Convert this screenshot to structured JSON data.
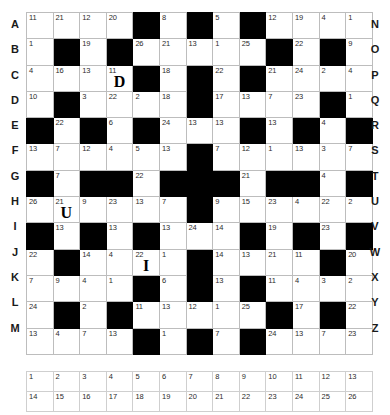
{
  "puzzle": {
    "type": "codeword",
    "rows": 13,
    "cols": 13,
    "row_labels_left": [
      "A",
      "B",
      "C",
      "D",
      "E",
      "F",
      "G",
      "H",
      "I",
      "J",
      "K",
      "L",
      "M"
    ],
    "row_labels_right": [
      "N",
      "O",
      "P",
      "Q",
      "R",
      "S",
      "T",
      "U",
      "V",
      "W",
      "X",
      "Y",
      "Z"
    ],
    "colors": {
      "black_cell": "#000000",
      "grid_line": "#bdbdbd",
      "text": "#2b2b2b"
    },
    "grid": [
      [
        {
          "black": false,
          "num": "11",
          "letter": ""
        },
        {
          "black": false,
          "num": "21",
          "letter": ""
        },
        {
          "black": false,
          "num": "12",
          "letter": ""
        },
        {
          "black": false,
          "num": "20",
          "letter": ""
        },
        {
          "black": true,
          "num": "",
          "letter": ""
        },
        {
          "black": false,
          "num": "8",
          "letter": ""
        },
        {
          "black": true,
          "num": "",
          "letter": ""
        },
        {
          "black": false,
          "num": "5",
          "letter": ""
        },
        {
          "black": true,
          "num": "",
          "letter": ""
        },
        {
          "black": false,
          "num": "12",
          "letter": ""
        },
        {
          "black": false,
          "num": "19",
          "letter": ""
        },
        {
          "black": false,
          "num": "4",
          "letter": ""
        },
        {
          "black": false,
          "num": "1",
          "letter": ""
        }
      ],
      [
        {
          "black": false,
          "num": "1",
          "letter": ""
        },
        {
          "black": true,
          "num": "",
          "letter": ""
        },
        {
          "black": false,
          "num": "19",
          "letter": ""
        },
        {
          "black": true,
          "num": "",
          "letter": ""
        },
        {
          "black": false,
          "num": "26",
          "letter": ""
        },
        {
          "black": false,
          "num": "21",
          "letter": ""
        },
        {
          "black": false,
          "num": "13",
          "letter": ""
        },
        {
          "black": false,
          "num": "1",
          "letter": ""
        },
        {
          "black": false,
          "num": "25",
          "letter": ""
        },
        {
          "black": true,
          "num": "",
          "letter": ""
        },
        {
          "black": false,
          "num": "22",
          "letter": ""
        },
        {
          "black": true,
          "num": "",
          "letter": ""
        },
        {
          "black": false,
          "num": "9",
          "letter": ""
        }
      ],
      [
        {
          "black": false,
          "num": "4",
          "letter": ""
        },
        {
          "black": false,
          "num": "16",
          "letter": ""
        },
        {
          "black": false,
          "num": "13",
          "letter": ""
        },
        {
          "black": false,
          "num": "11",
          "letter": "D"
        },
        {
          "black": true,
          "num": "",
          "letter": ""
        },
        {
          "black": false,
          "num": "18",
          "letter": ""
        },
        {
          "black": true,
          "num": "",
          "letter": ""
        },
        {
          "black": false,
          "num": "22",
          "letter": ""
        },
        {
          "black": true,
          "num": "",
          "letter": ""
        },
        {
          "black": false,
          "num": "21",
          "letter": ""
        },
        {
          "black": false,
          "num": "24",
          "letter": ""
        },
        {
          "black": false,
          "num": "2",
          "letter": ""
        },
        {
          "black": false,
          "num": "4",
          "letter": ""
        }
      ],
      [
        {
          "black": false,
          "num": "10",
          "letter": ""
        },
        {
          "black": true,
          "num": "",
          "letter": ""
        },
        {
          "black": false,
          "num": "3",
          "letter": ""
        },
        {
          "black": false,
          "num": "22",
          "letter": ""
        },
        {
          "black": false,
          "num": "2",
          "letter": ""
        },
        {
          "black": false,
          "num": "18",
          "letter": ""
        },
        {
          "black": true,
          "num": "",
          "letter": ""
        },
        {
          "black": false,
          "num": "17",
          "letter": ""
        },
        {
          "black": false,
          "num": "13",
          "letter": ""
        },
        {
          "black": false,
          "num": "7",
          "letter": ""
        },
        {
          "black": false,
          "num": "23",
          "letter": ""
        },
        {
          "black": true,
          "num": "",
          "letter": ""
        },
        {
          "black": false,
          "num": "1",
          "letter": ""
        }
      ],
      [
        {
          "black": true,
          "num": "",
          "letter": ""
        },
        {
          "black": false,
          "num": "22",
          "letter": ""
        },
        {
          "black": true,
          "num": "",
          "letter": ""
        },
        {
          "black": false,
          "num": "6",
          "letter": ""
        },
        {
          "black": true,
          "num": "",
          "letter": ""
        },
        {
          "black": false,
          "num": "24",
          "letter": ""
        },
        {
          "black": false,
          "num": "13",
          "letter": ""
        },
        {
          "black": false,
          "num": "13",
          "letter": ""
        },
        {
          "black": true,
          "num": "",
          "letter": ""
        },
        {
          "black": false,
          "num": "13",
          "letter": ""
        },
        {
          "black": true,
          "num": "",
          "letter": ""
        },
        {
          "black": false,
          "num": "4",
          "letter": ""
        },
        {
          "black": true,
          "num": "",
          "letter": ""
        }
      ],
      [
        {
          "black": false,
          "num": "13",
          "letter": ""
        },
        {
          "black": false,
          "num": "7",
          "letter": ""
        },
        {
          "black": false,
          "num": "12",
          "letter": ""
        },
        {
          "black": false,
          "num": "4",
          "letter": ""
        },
        {
          "black": false,
          "num": "5",
          "letter": ""
        },
        {
          "black": false,
          "num": "13",
          "letter": ""
        },
        {
          "black": true,
          "num": "",
          "letter": ""
        },
        {
          "black": false,
          "num": "7",
          "letter": ""
        },
        {
          "black": false,
          "num": "12",
          "letter": ""
        },
        {
          "black": false,
          "num": "1",
          "letter": ""
        },
        {
          "black": false,
          "num": "13",
          "letter": ""
        },
        {
          "black": false,
          "num": "3",
          "letter": ""
        },
        {
          "black": false,
          "num": "7",
          "letter": ""
        }
      ],
      [
        {
          "black": true,
          "num": "",
          "letter": ""
        },
        {
          "black": false,
          "num": "7",
          "letter": ""
        },
        {
          "black": true,
          "num": "",
          "letter": ""
        },
        {
          "black": true,
          "num": "",
          "letter": ""
        },
        {
          "black": false,
          "num": "22",
          "letter": ""
        },
        {
          "black": true,
          "num": "",
          "letter": ""
        },
        {
          "black": true,
          "num": "",
          "letter": ""
        },
        {
          "black": true,
          "num": "",
          "letter": ""
        },
        {
          "black": false,
          "num": "21",
          "letter": ""
        },
        {
          "black": true,
          "num": "",
          "letter": ""
        },
        {
          "black": true,
          "num": "",
          "letter": ""
        },
        {
          "black": false,
          "num": "4",
          "letter": ""
        },
        {
          "black": true,
          "num": "",
          "letter": ""
        }
      ],
      [
        {
          "black": false,
          "num": "26",
          "letter": ""
        },
        {
          "black": false,
          "num": "21",
          "letter": "U"
        },
        {
          "black": false,
          "num": "9",
          "letter": ""
        },
        {
          "black": false,
          "num": "23",
          "letter": ""
        },
        {
          "black": false,
          "num": "13",
          "letter": ""
        },
        {
          "black": false,
          "num": "7",
          "letter": ""
        },
        {
          "black": true,
          "num": "",
          "letter": ""
        },
        {
          "black": false,
          "num": "9",
          "letter": ""
        },
        {
          "black": false,
          "num": "15",
          "letter": ""
        },
        {
          "black": false,
          "num": "23",
          "letter": ""
        },
        {
          "black": false,
          "num": "4",
          "letter": ""
        },
        {
          "black": false,
          "num": "22",
          "letter": ""
        },
        {
          "black": false,
          "num": "2",
          "letter": ""
        }
      ],
      [
        {
          "black": true,
          "num": "",
          "letter": ""
        },
        {
          "black": false,
          "num": "13",
          "letter": ""
        },
        {
          "black": true,
          "num": "",
          "letter": ""
        },
        {
          "black": false,
          "num": "13",
          "letter": ""
        },
        {
          "black": true,
          "num": "",
          "letter": ""
        },
        {
          "black": false,
          "num": "13",
          "letter": ""
        },
        {
          "black": false,
          "num": "24",
          "letter": ""
        },
        {
          "black": false,
          "num": "14",
          "letter": ""
        },
        {
          "black": true,
          "num": "",
          "letter": ""
        },
        {
          "black": false,
          "num": "19",
          "letter": ""
        },
        {
          "black": true,
          "num": "",
          "letter": ""
        },
        {
          "black": false,
          "num": "23",
          "letter": ""
        },
        {
          "black": true,
          "num": "",
          "letter": ""
        }
      ],
      [
        {
          "black": false,
          "num": "22",
          "letter": ""
        },
        {
          "black": true,
          "num": "",
          "letter": ""
        },
        {
          "black": false,
          "num": "14",
          "letter": ""
        },
        {
          "black": false,
          "num": "4",
          "letter": ""
        },
        {
          "black": false,
          "num": "22",
          "letter": "I"
        },
        {
          "black": false,
          "num": "1",
          "letter": ""
        },
        {
          "black": true,
          "num": "",
          "letter": ""
        },
        {
          "black": false,
          "num": "14",
          "letter": ""
        },
        {
          "black": false,
          "num": "13",
          "letter": ""
        },
        {
          "black": false,
          "num": "21",
          "letter": ""
        },
        {
          "black": false,
          "num": "11",
          "letter": ""
        },
        {
          "black": true,
          "num": "",
          "letter": ""
        },
        {
          "black": false,
          "num": "20",
          "letter": ""
        }
      ],
      [
        {
          "black": false,
          "num": "7",
          "letter": ""
        },
        {
          "black": false,
          "num": "9",
          "letter": ""
        },
        {
          "black": false,
          "num": "4",
          "letter": ""
        },
        {
          "black": false,
          "num": "1",
          "letter": ""
        },
        {
          "black": true,
          "num": "",
          "letter": ""
        },
        {
          "black": false,
          "num": "6",
          "letter": ""
        },
        {
          "black": true,
          "num": "",
          "letter": ""
        },
        {
          "black": false,
          "num": "13",
          "letter": ""
        },
        {
          "black": true,
          "num": "",
          "letter": ""
        },
        {
          "black": false,
          "num": "11",
          "letter": ""
        },
        {
          "black": false,
          "num": "4",
          "letter": ""
        },
        {
          "black": false,
          "num": "3",
          "letter": ""
        },
        {
          "black": false,
          "num": "2",
          "letter": ""
        }
      ],
      [
        {
          "black": false,
          "num": "24",
          "letter": ""
        },
        {
          "black": true,
          "num": "",
          "letter": ""
        },
        {
          "black": false,
          "num": "2",
          "letter": ""
        },
        {
          "black": true,
          "num": "",
          "letter": ""
        },
        {
          "black": false,
          "num": "11",
          "letter": ""
        },
        {
          "black": false,
          "num": "13",
          "letter": ""
        },
        {
          "black": false,
          "num": "12",
          "letter": ""
        },
        {
          "black": false,
          "num": "1",
          "letter": ""
        },
        {
          "black": false,
          "num": "25",
          "letter": ""
        },
        {
          "black": true,
          "num": "",
          "letter": ""
        },
        {
          "black": false,
          "num": "17",
          "letter": ""
        },
        {
          "black": true,
          "num": "",
          "letter": ""
        },
        {
          "black": false,
          "num": "22",
          "letter": ""
        }
      ],
      [
        {
          "black": false,
          "num": "13",
          "letter": ""
        },
        {
          "black": false,
          "num": "4",
          "letter": ""
        },
        {
          "black": false,
          "num": "7",
          "letter": ""
        },
        {
          "black": false,
          "num": "13",
          "letter": ""
        },
        {
          "black": true,
          "num": "",
          "letter": ""
        },
        {
          "black": false,
          "num": "1",
          "letter": ""
        },
        {
          "black": true,
          "num": "",
          "letter": ""
        },
        {
          "black": false,
          "num": "7",
          "letter": ""
        },
        {
          "black": true,
          "num": "",
          "letter": ""
        },
        {
          "black": false,
          "num": "24",
          "letter": ""
        },
        {
          "black": false,
          "num": "13",
          "letter": ""
        },
        {
          "black": false,
          "num": "7",
          "letter": ""
        },
        {
          "black": false,
          "num": "23",
          "letter": ""
        }
      ]
    ]
  },
  "legend": {
    "rows": [
      [
        {
          "num": "1",
          "letter": ""
        },
        {
          "num": "2",
          "letter": ""
        },
        {
          "num": "3",
          "letter": ""
        },
        {
          "num": "4",
          "letter": ""
        },
        {
          "num": "5",
          "letter": ""
        },
        {
          "num": "6",
          "letter": ""
        },
        {
          "num": "7",
          "letter": ""
        },
        {
          "num": "8",
          "letter": ""
        },
        {
          "num": "9",
          "letter": ""
        },
        {
          "num": "10",
          "letter": ""
        },
        {
          "num": "11",
          "letter": ""
        },
        {
          "num": "12",
          "letter": ""
        },
        {
          "num": "13",
          "letter": ""
        }
      ],
      [
        {
          "num": "14",
          "letter": ""
        },
        {
          "num": "15",
          "letter": ""
        },
        {
          "num": "16",
          "letter": ""
        },
        {
          "num": "17",
          "letter": ""
        },
        {
          "num": "18",
          "letter": ""
        },
        {
          "num": "19",
          "letter": ""
        },
        {
          "num": "20",
          "letter": ""
        },
        {
          "num": "21",
          "letter": ""
        },
        {
          "num": "22",
          "letter": ""
        },
        {
          "num": "23",
          "letter": ""
        },
        {
          "num": "24",
          "letter": ""
        },
        {
          "num": "25",
          "letter": ""
        },
        {
          "num": "26",
          "letter": ""
        }
      ]
    ]
  }
}
